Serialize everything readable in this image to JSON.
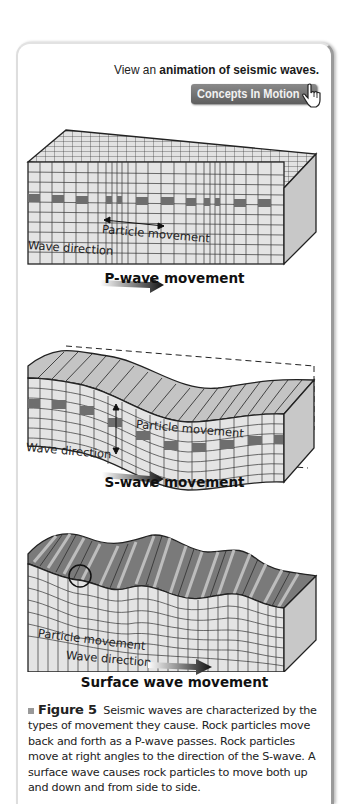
{
  "header": {
    "view_prefix": "View an ",
    "view_link": "animation of seismic waves.",
    "button_label": "Concepts In Motion",
    "button_icon": "hand-pointer-icon"
  },
  "diagrams": [
    {
      "id": "p-wave",
      "title": "P-wave movement",
      "particle_label": "Particle movement",
      "wave_label": "Wave direction"
    },
    {
      "id": "s-wave",
      "title": "S-wave movement",
      "particle_label": "Particle movement",
      "wave_label": "Wave direction"
    },
    {
      "id": "surface-wave",
      "title": "Surface wave movement",
      "particle_label": "Particle movement",
      "wave_label": "Wave direction"
    }
  ],
  "caption": {
    "figure_label": "Figure 5",
    "text": "Seismic waves are characterized by the types of movement they cause. Rock particles move back and forth as a P-wave passes. Rock particles move at right angles to the direction of the S-wave. A surface wave causes rock particles to move both up and down and from side to side."
  },
  "colors": {
    "block_face": "#e4e4e4",
    "block_side": "#c8c8c8",
    "marker_cell": "#6e6e6e",
    "top_stripe_dark": "#7a7a7a",
    "top_stripe_light": "#bdbdbd",
    "button_bg": "#6e6e6e"
  }
}
